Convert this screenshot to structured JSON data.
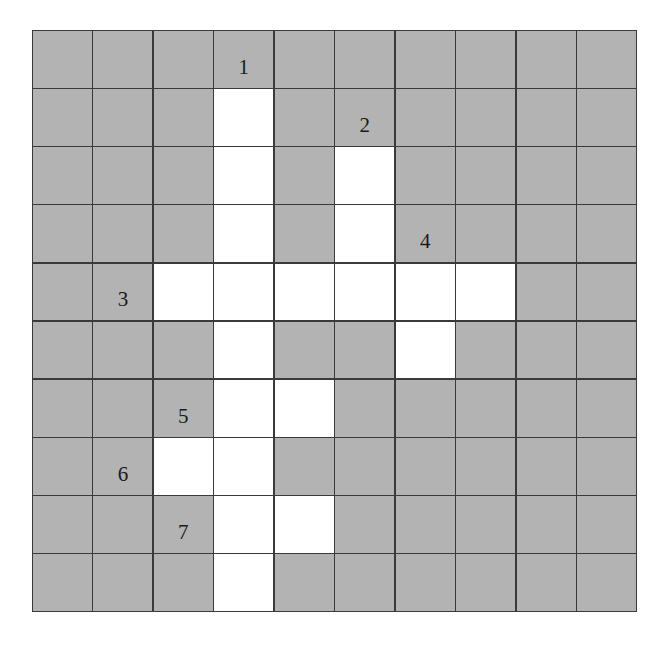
{
  "puzzle": {
    "type": "crossword",
    "rows": 10,
    "cols": 10,
    "colors": {
      "blocked": "#b3b3b3",
      "open": "#ffffff",
      "grid_line": "#3a3a3a"
    },
    "open_cells": [
      [
        1,
        3
      ],
      [
        2,
        3
      ],
      [
        3,
        3
      ],
      [
        4,
        3
      ],
      [
        5,
        3
      ],
      [
        6,
        3
      ],
      [
        7,
        3
      ],
      [
        8,
        3
      ],
      [
        9,
        3
      ],
      [
        2,
        5
      ],
      [
        3,
        5
      ],
      [
        4,
        2
      ],
      [
        4,
        4
      ],
      [
        4,
        5
      ],
      [
        4,
        6
      ],
      [
        4,
        7
      ],
      [
        5,
        6
      ],
      [
        6,
        4
      ],
      [
        7,
        2
      ],
      [
        8,
        4
      ]
    ],
    "clue_numbers": [
      {
        "number": "1",
        "row": 0,
        "col": 3,
        "direction": "down"
      },
      {
        "number": "2",
        "row": 1,
        "col": 5,
        "direction": "down"
      },
      {
        "number": "3",
        "row": 4,
        "col": 1,
        "direction": "across"
      },
      {
        "number": "4",
        "row": 3,
        "col": 6,
        "direction": "down"
      },
      {
        "number": "5",
        "row": 6,
        "col": 2,
        "direction": "across"
      },
      {
        "number": "6",
        "row": 7,
        "col": 1,
        "direction": "across"
      },
      {
        "number": "7",
        "row": 8,
        "col": 2,
        "direction": "across"
      }
    ]
  }
}
